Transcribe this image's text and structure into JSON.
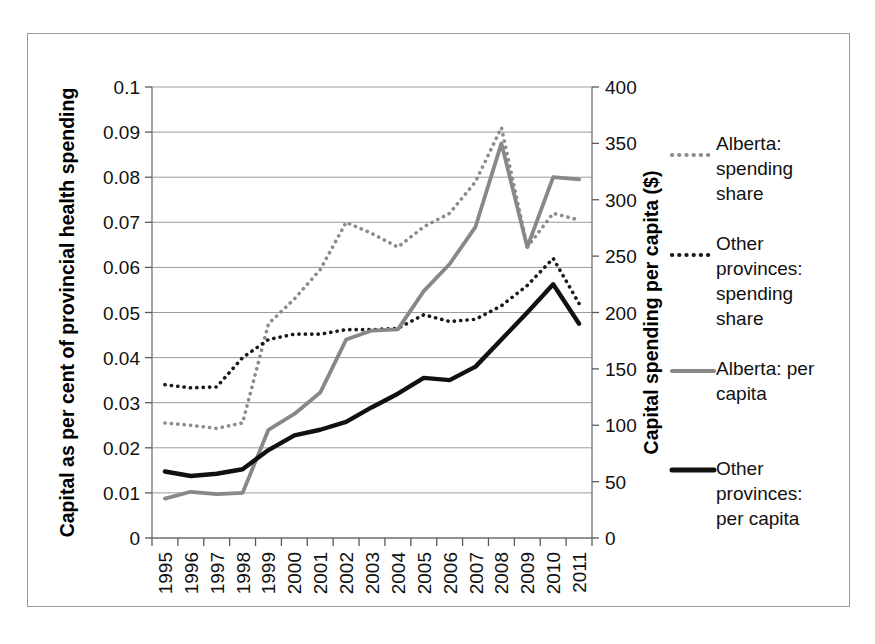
{
  "chart_data": {
    "type": "line",
    "title": "",
    "xlabel": "",
    "ylabel": "Capital as per cent of provincial health spending",
    "y2label": "Capital spending per capita ($)",
    "categories": [
      "1995",
      "1996",
      "1997",
      "1998",
      "1999",
      "2000",
      "2001",
      "2002",
      "2003",
      "2004",
      "2005",
      "2006",
      "2007",
      "2008",
      "2009",
      "2010",
      "2011"
    ],
    "ylim": [
      0,
      0.1
    ],
    "yticks": [
      "0",
      "0.01",
      "0.02",
      "0.03",
      "0.04",
      "0.05",
      "0.06",
      "0.07",
      "0.08",
      "0.09",
      "0.1"
    ],
    "ytick_values": [
      0,
      0.01,
      0.02,
      0.03,
      0.04,
      0.05,
      0.06,
      0.07,
      0.08,
      0.09,
      0.1
    ],
    "y2lim": [
      0,
      400
    ],
    "y2ticks": [
      "0",
      "50",
      "100",
      "150",
      "200",
      "250",
      "300",
      "350",
      "400"
    ],
    "y2tick_values": [
      0,
      50,
      100,
      150,
      200,
      250,
      300,
      350,
      400
    ],
    "grid": true,
    "legend_position": "right",
    "series": [
      {
        "name": "Alberta: spending share",
        "axis": "left",
        "style": "dotted",
        "color": "#8c8c8c",
        "values": [
          0.0255,
          0.025,
          0.0243,
          0.0255,
          0.0475,
          0.053,
          0.0595,
          0.07,
          0.0675,
          0.0645,
          0.069,
          0.072,
          0.079,
          0.091,
          0.0645,
          0.072,
          0.0705
        ]
      },
      {
        "name": "Other provinces: spending share",
        "axis": "left",
        "style": "dotted",
        "color": "#1a1a1a",
        "values": [
          0.034,
          0.0333,
          0.0335,
          0.04,
          0.044,
          0.0452,
          0.0452,
          0.0462,
          0.0462,
          0.0465,
          0.0495,
          0.048,
          0.0485,
          0.0515,
          0.056,
          0.062,
          0.052
        ]
      },
      {
        "name": "Alberta: per capita",
        "axis": "right",
        "style": "solid",
        "color": "#888888",
        "values": [
          35,
          41,
          39,
          40,
          96,
          110,
          129,
          176,
          184,
          185,
          219,
          243,
          276,
          350,
          258,
          320,
          318
        ]
      },
      {
        "name": "Other provinces: per capita",
        "axis": "right",
        "style": "solid",
        "color": "#111111",
        "values": [
          59,
          55,
          57,
          61,
          78,
          91,
          96,
          103,
          116,
          128,
          142,
          140,
          152,
          176,
          200,
          225,
          190
        ]
      }
    ]
  },
  "legend": {
    "items": [
      {
        "label_lines": [
          "Alberta:",
          "spending",
          "share"
        ],
        "swatch": "dotted-gray"
      },
      {
        "label_lines": [
          "Other",
          "provinces:",
          "spending",
          "share"
        ],
        "swatch": "dotted-black"
      },
      {
        "label_lines": [
          "Alberta: per",
          "capita"
        ],
        "swatch": "solid-gray"
      },
      {
        "label_lines": [
          "Other",
          "provinces:",
          "per capita"
        ],
        "swatch": "solid-black"
      }
    ]
  },
  "colors": {
    "alberta_share": "#8c8c8c",
    "other_share": "#1a1a1a",
    "alberta_percapita": "#888888",
    "other_percapita": "#111111",
    "grid": "#9b9b9b",
    "frame": "#9a9a9a"
  }
}
